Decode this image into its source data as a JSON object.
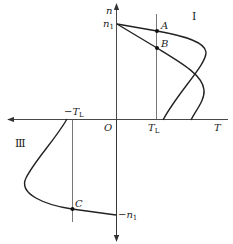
{
  "diagram": {
    "axes": {
      "vertical_label": "n",
      "horizontal_label": "T",
      "origin_label": "O"
    },
    "labels": {
      "n1": "n",
      "n1_sub": "1",
      "neg_n1": "−n",
      "neg_n1_sub": "1",
      "TL": "T",
      "TL_sub": "L",
      "neg_TL": "−T",
      "neg_TL_sub": "L"
    },
    "quadrants": {
      "q1": "I",
      "q3": "Ⅲ"
    },
    "points": [
      {
        "id": "A",
        "label": "A"
      },
      {
        "id": "B",
        "label": "B"
      },
      {
        "id": "C",
        "label": "C"
      }
    ]
  }
}
